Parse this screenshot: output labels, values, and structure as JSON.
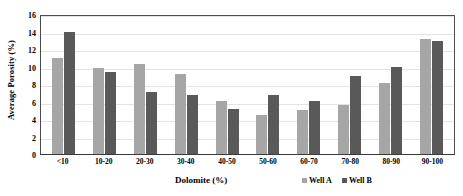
{
  "chart_data": {
    "type": "bar",
    "title": "",
    "xlabel": "Dolomite (%)",
    "ylabel": "Average Porosity (%)",
    "categories": [
      "<10",
      "10-20",
      "20-30",
      "30-40",
      "40-50",
      "50-60",
      "60-70",
      "70-80",
      "80-90",
      "90-100"
    ],
    "series": [
      {
        "name": "Well A",
        "color": "#a6a6a6",
        "values": [
          11.0,
          9.8,
          10.3,
          9.2,
          6.1,
          4.5,
          5.0,
          5.6,
          8.1,
          13.2
        ]
      },
      {
        "name": "Well B",
        "color": "#595959",
        "values": [
          14.0,
          9.4,
          7.1,
          6.7,
          5.2,
          6.8,
          6.1,
          8.9,
          9.9,
          12.9
        ]
      }
    ],
    "ylim": [
      0,
      16
    ],
    "ytick_step": 2,
    "yticks": [
      16,
      14,
      12,
      10,
      8,
      6,
      4,
      2,
      0
    ],
    "grid": true,
    "legend_position": "bottom-right"
  },
  "legend": {
    "items": [
      {
        "label": "Well A",
        "color": "#a6a6a6"
      },
      {
        "label": "Well B",
        "color": "#595959"
      }
    ]
  },
  "colors": {
    "series_a": "#a6a6a6",
    "series_b": "#595959",
    "gridline": "#e3e3e3",
    "axis": "#4d4d4d",
    "background": "#ffffff"
  }
}
